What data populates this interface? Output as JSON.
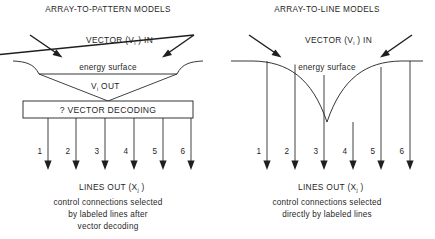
{
  "figure": {
    "background_color": "#ffffff",
    "ink_color": "#1f1f1f"
  },
  "panels": [
    {
      "id": "array-to-pattern",
      "title": "ARRAY-TO-PATTERN MODELS",
      "vector_in_label": "VECTOR (V",
      "vector_in_sub": "i",
      "vector_in_tail": " ) IN",
      "energy_surface_label": "energy  surface",
      "vector_out_label": "V",
      "vector_out_sub": "i",
      "vector_out_tail": " OUT",
      "decoder_box_label": "? VECTOR DECODING",
      "line_numbers": [
        "1",
        "2",
        "3",
        "4",
        "5",
        "6"
      ],
      "lines_out_label": "LINES OUT (X",
      "lines_out_sub": "j",
      "lines_out_tail": " )",
      "caption_lines": [
        "control  connections  selected",
        "by  labeled  lines  after",
        "vector  decoding"
      ]
    },
    {
      "id": "array-to-line",
      "title": "ARRAY-TO-LINE MODELS",
      "vector_in_label": "VECTOR (V",
      "vector_in_sub": "i",
      "vector_in_tail": " ) IN",
      "energy_surface_label": "energy  surface",
      "line_numbers": [
        "1",
        "2",
        "3",
        "4",
        "5",
        "6"
      ],
      "lines_out_label": "LINES OUT (X",
      "lines_out_sub": "j",
      "lines_out_tail": " )",
      "caption_lines": [
        "control  connections  selected",
        "directly  by  labeled  lines"
      ]
    }
  ]
}
